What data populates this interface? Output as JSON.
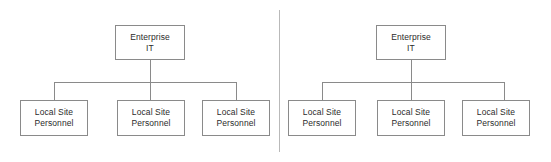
{
  "diagram": {
    "divider_label": "panel-divider",
    "colors": {
      "background": "#ffffff",
      "box_border": "#8a8a8a",
      "connector": "#8a8a8a",
      "divider": "#b9b9b9",
      "text": "#2b2b2b"
    },
    "panels": [
      {
        "name": "left-panel",
        "root": {
          "line1": "Enterprise",
          "line2": "IT"
        },
        "children": [
          {
            "line1": "Local Site",
            "line2": "Personnel"
          },
          {
            "line1": "Local Site",
            "line2": "Personnel"
          },
          {
            "line1": "Local Site",
            "line2": "Personnel"
          }
        ]
      },
      {
        "name": "right-panel",
        "root": {
          "line1": "Enterprise",
          "line2": "IT"
        },
        "children": [
          {
            "line1": "Local Site",
            "line2": "Personnel"
          },
          {
            "line1": "Local Site",
            "line2": "Personnel"
          },
          {
            "line1": "Local Site",
            "line2": "Personnel"
          }
        ]
      }
    ]
  }
}
